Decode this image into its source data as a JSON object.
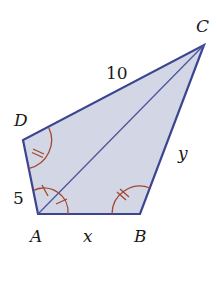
{
  "diagram": {
    "type": "geometry-quadrilateral",
    "colors": {
      "fill": "#d3d6e4",
      "edge": "#3b4590",
      "diagonal": "#4a56a0",
      "angle_marks": "#a0482e",
      "text": "#1a1a1a"
    },
    "vertices": {
      "A": {
        "label": "A",
        "x": 38,
        "y": 214
      },
      "B": {
        "label": "B",
        "x": 140,
        "y": 214
      },
      "C": {
        "label": "C",
        "x": 204,
        "y": 45
      },
      "D": {
        "label": "D",
        "x": 23,
        "y": 140
      }
    },
    "sides": {
      "DC": {
        "label": "10"
      },
      "AD": {
        "label": "5"
      },
      "AB": {
        "label": "x"
      },
      "BC": {
        "label": "y"
      }
    },
    "diagonal": "AC",
    "angle_marks": [
      {
        "vertex": "D",
        "ticks": 2,
        "note": "angle ADC"
      },
      {
        "vertex": "B",
        "ticks": 2,
        "note": "angle ABC, equal to angle D"
      },
      {
        "vertex": "A",
        "ticks": 1,
        "note": "angle DAC"
      },
      {
        "vertex": "A",
        "ticks": 1,
        "note": "angle CAB, equal to angle DAC"
      }
    ]
  }
}
